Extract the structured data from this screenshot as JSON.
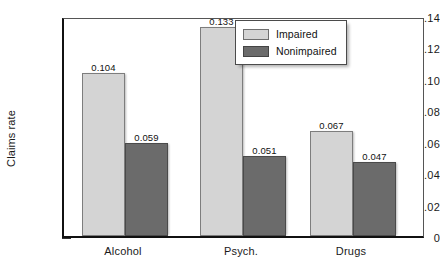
{
  "chart_data": {
    "type": "bar",
    "title": "",
    "xlabel": "",
    "ylabel": "Claims rate",
    "categories": [
      "Alcohol",
      "Psych.",
      "Drugs"
    ],
    "series": [
      {
        "name": "Impaired",
        "color": "#d4d4d4",
        "values": [
          0.104,
          0.133,
          0.067
        ]
      },
      {
        "name": "Nonimpaired",
        "color": "#6b6b6b",
        "values": [
          0.059,
          0.051,
          0.047
        ]
      }
    ],
    "value_labels": [
      [
        "0.104",
        "0.133",
        "0.067"
      ],
      [
        "0.059",
        "0.051",
        "0.047"
      ]
    ],
    "ylim": [
      0,
      0.14
    ],
    "yticks": [
      0,
      0.02,
      0.04,
      0.06,
      0.08,
      0.1,
      0.12,
      0.14
    ],
    "ytick_labels": [
      "0",
      ".02",
      ".04",
      ".06",
      ".08",
      ".10",
      ".12",
      ".14"
    ],
    "grid": false,
    "legend_position": "top-right-inside",
    "frame": true
  },
  "legend": {
    "items": [
      {
        "label": "Impaired",
        "color": "#d4d4d4"
      },
      {
        "label": "Nonimpaired",
        "color": "#6b6b6b"
      }
    ]
  }
}
